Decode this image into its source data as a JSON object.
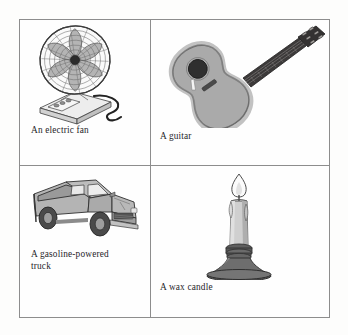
{
  "figure": {
    "layout": "2x2 grid of captioned grayscale line illustrations",
    "background_color": "#fdfdfc",
    "border_color": "#8d8d8d",
    "text_color": "#26252a",
    "cells": [
      {
        "id": "fan",
        "caption": "An electric fan",
        "illustration": "electric-fan-illustration",
        "position": "top-left",
        "colors": {
          "cage": "#6e6e6e",
          "blade": "#b9b9b9",
          "base": "#e6e6e6",
          "cord": "#2e2e2e"
        }
      },
      {
        "id": "guitar",
        "caption": "A guitar",
        "illustration": "acoustic-guitar-illustration",
        "position": "top-right",
        "colors": {
          "body": "#a8a8a8",
          "body_edge": "#8a8a8a",
          "soundhole": "#333333",
          "neck": "#3a3a3a",
          "pickguard": "#f2f2f2"
        }
      },
      {
        "id": "truck",
        "caption": "A gasoline-powered\ntruck",
        "illustration": "pickup-truck-illustration",
        "position": "bottom-left",
        "colors": {
          "body": "#a9a9a9",
          "body_light": "#c3c3c3",
          "window": "#e9e9e9",
          "wheel": "#4a4a4a",
          "grille": "#555555"
        }
      },
      {
        "id": "candle",
        "caption": "A wax candle",
        "illustration": "lit-wax-candle-illustration",
        "position": "bottom-right",
        "colors": {
          "wax": "#cfcfcf",
          "wax_shade": "#ababab",
          "holder": "#6b6b6b",
          "holder_dark": "#4f4f4f",
          "flame": "#f4f4f4"
        }
      }
    ]
  }
}
